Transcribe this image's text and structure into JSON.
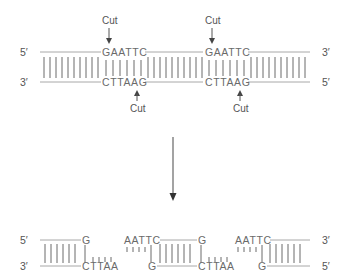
{
  "diagram": {
    "colors": {
      "strand_line": "#a8a8a8",
      "text": "#555555",
      "base_pair_bars": "#6a6a6a"
    },
    "intact_dna": {
      "top_strand_left_label": "5′",
      "top_strand_right_label": "3′",
      "bottom_strand_left_label": "3′",
      "bottom_strand_right_label": "5′",
      "sites": [
        {
          "top_seq": "GAATTC",
          "bottom_seq": "CTTAAG",
          "top_cut_label": "Cut",
          "bottom_cut_label": "Cut"
        },
        {
          "top_seq": "GAATTC",
          "bottom_seq": "CTTAAG",
          "top_cut_label": "Cut",
          "bottom_cut_label": "Cut"
        }
      ]
    },
    "process_arrow": "down-arrow",
    "cut_dna": {
      "top_strand_left_label": "5′",
      "top_strand_right_label": "3′",
      "bottom_strand_left_label": "3′",
      "bottom_strand_right_label": "5′",
      "fragments": [
        {
          "top_end": "G",
          "bottom_end": "CTTAA"
        },
        {
          "top_start": "AATTC",
          "bottom_start": "G",
          "top_end": "G",
          "bottom_end": "CTTAA"
        },
        {
          "top_start": "AATTC",
          "bottom_start": "G"
        }
      ]
    }
  }
}
